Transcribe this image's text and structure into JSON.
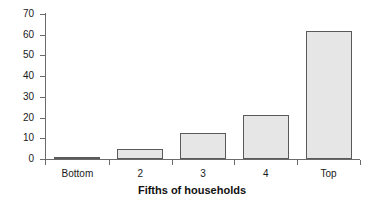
{
  "chart_data": {
    "type": "bar",
    "title": "",
    "subtitle": "",
    "xlabel": "Fifths of households",
    "ylabel": "",
    "categories": [
      "Bottom",
      "2",
      "3",
      "4",
      "Top"
    ],
    "values": [
      0.8,
      4.7,
      12.6,
      21.4,
      62.0
    ],
    "series": [
      {
        "name": "Share",
        "values": [
          0.8,
          4.7,
          12.6,
          21.4,
          62.0
        ]
      }
    ],
    "ylim": [
      0,
      70
    ],
    "yticks": [
      0,
      10,
      20,
      30,
      40,
      50,
      60,
      70
    ],
    "ytick_labels": [
      "0",
      "10",
      "20",
      "30",
      "40",
      "50",
      "60",
      "70"
    ],
    "xtick_labels": [
      "Bottom",
      "2",
      "3",
      "4",
      "Top"
    ],
    "grid": false,
    "legend": false,
    "legend_position": "none",
    "bar_fill_color": "#e6e6e6",
    "bar_edge_color": "#5a5a5a",
    "axis_color": "#6b6b6b",
    "text_color": "#1a1a1a",
    "background_color": "#ffffff"
  }
}
